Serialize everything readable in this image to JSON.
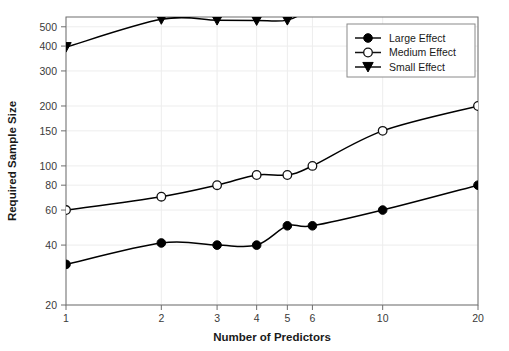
{
  "chart_data": {
    "type": "line",
    "title": "",
    "subtitle": "",
    "xlabel": "Number of Predictors",
    "ylabel": "Required Sample Size",
    "xscale": "log",
    "yscale": "log",
    "xlim": [
      1,
      20
    ],
    "ylim": [
      20,
      560
    ],
    "grid": true,
    "legend_position": "top-right",
    "x": [
      1,
      2,
      3,
      4,
      5,
      6,
      10,
      20
    ],
    "xtick_labels": [
      "1",
      "2",
      "3",
      "4",
      "5",
      "6",
      "10",
      "20"
    ],
    "ytick_values": [
      20,
      40,
      60,
      80,
      100,
      150,
      200,
      300,
      400,
      500
    ],
    "ytick_labels": [
      "20",
      "40",
      "60",
      "80",
      "100",
      "150",
      "200",
      "300",
      "400",
      "500"
    ],
    "series": [
      {
        "name": "Large Effect",
        "marker": "filled-circle",
        "color": "#000000",
        "values": [
          32,
          41,
          40,
          40,
          50,
          50,
          60,
          80
        ]
      },
      {
        "name": "Medium Effect",
        "marker": "open-circle",
        "color": "#000000",
        "values": [
          60,
          70,
          80,
          90,
          90,
          100,
          150,
          200
        ]
      },
      {
        "name": "Small Effect",
        "marker": "filled-triangle-down",
        "color": "#000000",
        "values": [
          395,
          545,
          540,
          538,
          540,
          620,
          900,
          1400
        ]
      }
    ]
  },
  "legend": {
    "items": [
      {
        "label": "Large Effect",
        "marker": "filled-circle"
      },
      {
        "label": "Medium Effect",
        "marker": "open-circle"
      },
      {
        "label": "Small Effect",
        "marker": "filled-triangle-down"
      }
    ]
  },
  "axes": {
    "x_title": "Number of Predictors",
    "y_title": "Required Sample Size"
  },
  "colors": {
    "line": "#111111",
    "grid": "#ededed",
    "axis": "#6e6e6e",
    "background": "#ffffff",
    "legend_border": "#8a8a8a",
    "text": "#1a1a1a"
  }
}
